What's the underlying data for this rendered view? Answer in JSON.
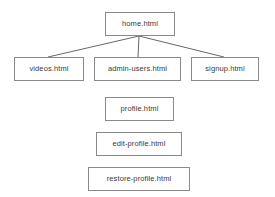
{
  "diagram": {
    "type": "site-map-tree",
    "background_color": "#ffffff",
    "box_border_color": "#8a8a8a",
    "box_fill_color": "#ffffff",
    "text_color": "#3b3b3b",
    "connector_color": "#555555",
    "nodes": [
      {
        "id": "home",
        "label": "home.html",
        "x": 105,
        "y": 12,
        "width": 70,
        "height": 24,
        "level": 0
      },
      {
        "id": "videos",
        "label": "videos.html",
        "x": 14,
        "y": 57,
        "width": 70,
        "height": 24,
        "level": 1
      },
      {
        "id": "admin-users",
        "label": "admin-users.html",
        "x": 94,
        "y": 57,
        "width": 87,
        "height": 24,
        "level": 1
      },
      {
        "id": "signup",
        "label": "signup.html",
        "x": 191,
        "y": 57,
        "width": 68,
        "height": 24,
        "level": 1
      },
      {
        "id": "profile",
        "label": "profile.html",
        "x": 105,
        "y": 97,
        "width": 69,
        "height": 24,
        "level": 2
      },
      {
        "id": "edit-profile",
        "label": "edit-profile.html",
        "x": 96,
        "y": 132,
        "width": 86,
        "height": 24,
        "level": 3
      },
      {
        "id": "restore-profile",
        "label": "restore-profile.html",
        "x": 88,
        "y": 167,
        "width": 102,
        "height": 24,
        "level": 4
      }
    ],
    "edges": [
      {
        "from": "home",
        "to": "videos",
        "x1": 139,
        "y1": 36,
        "x2": 48,
        "y2": 57
      },
      {
        "from": "home",
        "to": "admin-users",
        "x1": 139,
        "y1": 36,
        "x2": 138,
        "y2": 57
      },
      {
        "from": "home",
        "to": "signup",
        "x1": 139,
        "y1": 36,
        "x2": 224,
        "y2": 57
      }
    ]
  }
}
